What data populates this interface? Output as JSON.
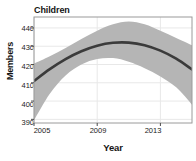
{
  "chart_data": {
    "type": "line",
    "title": "Children",
    "subtitle": "",
    "xlabel": "Year",
    "ylabel": "Members",
    "xlim": [
      2005,
      2015
    ],
    "ylim": [
      388,
      446
    ],
    "xticks": [
      2005,
      2009,
      2013
    ],
    "xtick_labels": [
      "2005",
      "2009",
      "2013"
    ],
    "yticks": [
      390,
      400,
      410,
      420,
      430,
      440
    ],
    "ytick_labels": [
      "390",
      "400",
      "410",
      "420",
      "430",
      "440"
    ],
    "grid": true,
    "grid_color": "#e8e8e8",
    "legend": "none",
    "series": [
      {
        "name": "Fitted trend",
        "type": "line",
        "color": "#3b3b3b",
        "line_width": 2.6,
        "x": [
          2005,
          2006,
          2007,
          2008,
          2009,
          2010,
          2011,
          2012,
          2013,
          2014,
          2015
        ],
        "values": [
          411.0,
          417.5,
          423.0,
          427.3,
          430.3,
          431.9,
          432.0,
          430.6,
          427.6,
          423.2,
          417.3
        ]
      },
      {
        "name": "Confidence band upper",
        "type": "band_upper",
        "color": "#b5b5b5",
        "x": [
          2005,
          2006,
          2007,
          2008,
          2009,
          2010,
          2011,
          2012,
          2013,
          2014,
          2015
        ],
        "values": [
          420.5,
          424.5,
          429.0,
          434.0,
          438.5,
          442.0,
          443.5,
          442.0,
          438.5,
          434.5,
          430.5
        ]
      },
      {
        "name": "Confidence band lower",
        "type": "band_lower",
        "color": "#b5b5b5",
        "x": [
          2005,
          2006,
          2007,
          2008,
          2009,
          2010,
          2011,
          2012,
          2013,
          2014,
          2015
        ],
        "values": [
          389.5,
          404.0,
          414.0,
          420.0,
          423.0,
          423.5,
          421.5,
          418.0,
          413.5,
          407.5,
          398.0
        ]
      }
    ],
    "band_fill_color": "#b5b5b5",
    "plot_background": "#ffffff",
    "frame_color": "#999999"
  }
}
